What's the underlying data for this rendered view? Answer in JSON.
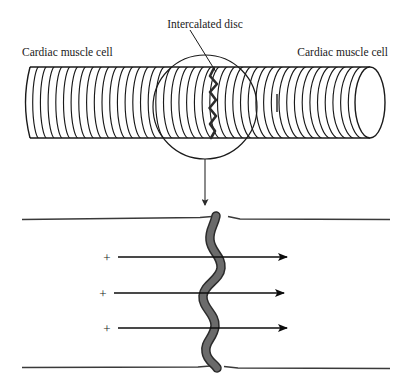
{
  "figure": {
    "title_label": "Intercalated disc",
    "left_cell_label": "Cardiac muscle cell",
    "right_cell_label": "Cardiac muscle cell",
    "charge_symbols": [
      "+",
      "+",
      "+"
    ],
    "colors": {
      "outline": "#1a1a1a",
      "striation": "#1a1a1a",
      "disc_band": "#6b6b6b",
      "disc_band_outline": "#2b2b2b",
      "membrane": "#3a3a3a",
      "background": "#ffffff"
    }
  },
  "chart_data": {
    "type": "diagram",
    "elements": [
      {
        "name": "cardiac-muscle-cell-left",
        "label": "Cardiac muscle cell"
      },
      {
        "name": "cardiac-muscle-cell-right",
        "label": "Cardiac muscle cell"
      },
      {
        "name": "intercalated-disc",
        "label": "Intercalated disc"
      },
      {
        "name": "magnifier-circle",
        "label": ""
      },
      {
        "name": "ion-flow-arrow-1",
        "label": "+"
      },
      {
        "name": "ion-flow-arrow-2",
        "label": "+"
      },
      {
        "name": "ion-flow-arrow-3",
        "label": "+"
      }
    ],
    "striation_count": 44,
    "ion_arrow_count": 3
  }
}
